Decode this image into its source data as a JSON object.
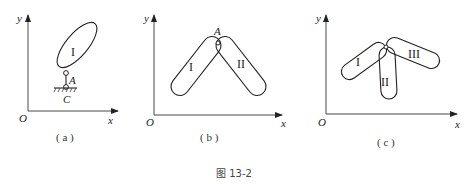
{
  "figure": {
    "caption": "图 13-2",
    "panels": [
      {
        "id": "a",
        "label": "( a )",
        "axes": {
          "origin": "O",
          "x": "x",
          "y": "y"
        },
        "bodies": [
          {
            "name": "I"
          }
        ],
        "points": [
          "A",
          "C"
        ]
      },
      {
        "id": "b",
        "label": "( b )",
        "axes": {
          "origin": "O",
          "x": "x",
          "y": "y"
        },
        "bodies": [
          {
            "name": "I"
          },
          {
            "name": "II"
          }
        ],
        "points": [
          "A"
        ]
      },
      {
        "id": "c",
        "label": "( c )",
        "axes": {
          "origin": "O",
          "x": "x",
          "y": "y"
        },
        "bodies": [
          {
            "name": "I"
          },
          {
            "name": "II"
          },
          {
            "name": "III"
          }
        ],
        "points": []
      }
    ]
  }
}
